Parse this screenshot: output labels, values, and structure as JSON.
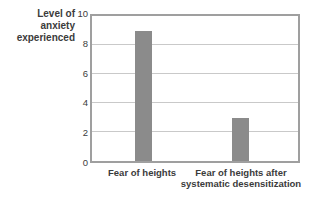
{
  "chart_data": {
    "type": "bar",
    "title": "",
    "ylabel": "Level of\nanxiety\nexperienced",
    "xlabel": "",
    "categories": [
      "Fear of heights",
      "Fear of heights after\nsystematic desensitization"
    ],
    "values": [
      9,
      3
    ],
    "ylim": [
      0,
      10
    ],
    "yticks": [
      0,
      2,
      4,
      6,
      8,
      10
    ],
    "gridline_values": [
      2,
      4,
      6,
      8
    ],
    "grid": true,
    "legend": "none"
  },
  "colors": {
    "bar": "#8b8b8b",
    "grid": "#c9c9c9",
    "plot_border": "#9f9f9f",
    "text": "#3b3b3b",
    "background": "#ffffff"
  }
}
